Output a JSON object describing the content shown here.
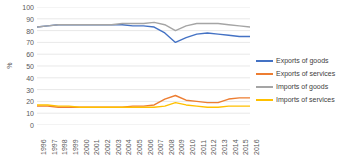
{
  "chart_data": {
    "type": "line",
    "title": "",
    "xlabel": "",
    "ylabel": "%",
    "ylim": [
      0,
      100
    ],
    "ytick_step": 10,
    "yticks": [
      100,
      90,
      80,
      70,
      60,
      50,
      40,
      30,
      20,
      10,
      0
    ],
    "grid": true,
    "grid_axis": "y",
    "legend_position": "right",
    "categories": [
      "1996",
      "1997",
      "1998",
      "1999",
      "2000",
      "2001",
      "2002",
      "2003",
      "2004",
      "2005",
      "2006",
      "2007",
      "2008",
      "2009",
      "2010",
      "2011",
      "2012",
      "2013",
      "2014",
      "2015",
      "2016"
    ],
    "series": [
      {
        "name": "Exports of goods",
        "color": "#4472C4",
        "values": [
          83,
          84,
          85,
          85,
          85,
          85,
          85,
          85,
          85,
          84,
          84,
          83,
          78,
          70,
          74,
          77,
          78,
          77,
          76,
          75,
          75
        ]
      },
      {
        "name": "Exports of services",
        "color": "#ED7D31",
        "values": [
          16,
          16,
          15,
          15,
          15,
          15,
          15,
          15,
          15,
          16,
          16,
          17,
          22,
          25,
          21,
          20,
          19,
          19,
          22,
          23,
          23
        ]
      },
      {
        "name": "Imports of goods",
        "color": "#A5A5A5",
        "values": [
          83,
          84,
          85,
          85,
          85,
          85,
          85,
          85,
          86,
          86,
          86,
          87,
          85,
          80,
          84,
          86,
          86,
          86,
          85,
          84,
          83
        ]
      },
      {
        "name": "Imports of services",
        "color": "#FFC000",
        "values": [
          17,
          17,
          16,
          16,
          15,
          15,
          15,
          15,
          15,
          15,
          15,
          15,
          16,
          19,
          17,
          16,
          15,
          15,
          16,
          16,
          16
        ]
      }
    ]
  },
  "legend": {
    "items": [
      {
        "label": "Exports of goods",
        "color": "#4472C4"
      },
      {
        "label": "Exports of services",
        "color": "#ED7D31"
      },
      {
        "label": "Imports of goods",
        "color": "#A5A5A5"
      },
      {
        "label": "Imports of services",
        "color": "#FFC000"
      }
    ]
  },
  "axes": {
    "y_title": "%"
  }
}
